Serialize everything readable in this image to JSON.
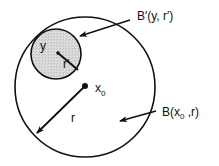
{
  "diagram": {
    "type": "ball-containment",
    "colors": {
      "stroke": "#111111",
      "inner_fill": "#d4d4d4",
      "background": "#ffffff"
    },
    "outer_ball": {
      "label_main": "B(x",
      "label_sub": "0",
      "label_tail": " ,r)",
      "center_label_main": "x",
      "center_label_sub": "0",
      "radius_label": "r"
    },
    "inner_ball": {
      "label": "B′(y, r′)",
      "center_label": "y",
      "radius_label": "r′"
    }
  }
}
